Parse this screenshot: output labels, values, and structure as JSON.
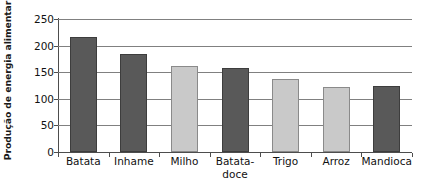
{
  "chart_data": {
    "type": "bar",
    "title": "",
    "subtitle": "",
    "xlabel": "",
    "ylabel": "Produção de energia alimentar",
    "categories": [
      "Batata",
      "Inhame",
      "Milho",
      "Batata-doce",
      "Trigo",
      "Arroz",
      "Mandioca"
    ],
    "category_lines": [
      [
        "Batata"
      ],
      [
        "Inhame"
      ],
      [
        "Milho"
      ],
      [
        "Batata-",
        "doce"
      ],
      [
        "Trigo"
      ],
      [
        "Arroz"
      ],
      [
        "Mandioca"
      ]
    ],
    "values": [
      217,
      185,
      162,
      157,
      137,
      123,
      125
    ],
    "bar_styles": [
      "dark",
      "dark",
      "light",
      "dark",
      "light",
      "light",
      "dark"
    ],
    "colors": {
      "dark_bar": "#595959",
      "dark_bar_edge": "#3d3d3d",
      "light_bar": "#c9c9c9",
      "light_bar_edge": "#8a8a8a",
      "gridline": "#808080",
      "axis": "#4d4d4d",
      "text": "#111111",
      "background": "#ffffff"
    },
    "ylim": [
      0,
      250
    ],
    "yticks": [
      0,
      50,
      100,
      150,
      200,
      250
    ],
    "ytick_labels": [
      "0",
      "50",
      "100",
      "150",
      "200",
      "250"
    ],
    "grid": true,
    "grid_axis": "y",
    "legend": false,
    "legend_position": "none"
  }
}
